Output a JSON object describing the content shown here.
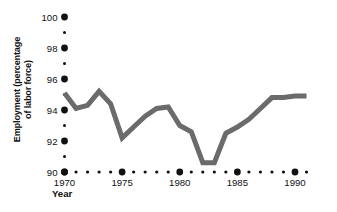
{
  "chart_data": {
    "type": "line",
    "title": "",
    "xlabel": "Year",
    "ylabel": "Employment (percentage of labor force)",
    "ylabel_line1": "Employment (percentage",
    "ylabel_line2": "of labor force)",
    "xlim": [
      1969.5,
      1991.2
    ],
    "ylim": [
      90,
      100
    ],
    "y_major_ticks": [
      90,
      92,
      94,
      96,
      98,
      100
    ],
    "y_major_tick_labels": [
      "90",
      "92",
      "94",
      "96",
      "98",
      "100"
    ],
    "y_minor_ticks": [
      91,
      93,
      95,
      97,
      99
    ],
    "x_major_ticks": [
      1970,
      1975,
      1980,
      1985,
      1990
    ],
    "x_major_tick_labels": [
      "1970",
      "1975",
      "1980",
      "1985",
      "1990"
    ],
    "x_minor_ticks": [
      1971,
      1972,
      1973,
      1974,
      1976,
      1977,
      1978,
      1979,
      1981,
      1982,
      1983,
      1984,
      1986,
      1987,
      1988,
      1989,
      1991
    ],
    "grid": false,
    "legend": null,
    "x": [
      1970,
      1971,
      1972,
      1973,
      1974,
      1975,
      1976,
      1977,
      1978,
      1979,
      1980,
      1981,
      1982,
      1983,
      1984,
      1985,
      1986,
      1987,
      1988,
      1989,
      1990,
      1991
    ],
    "values": [
      95.1,
      94.1,
      94.3,
      95.2,
      94.4,
      92.2,
      92.9,
      93.6,
      94.1,
      94.2,
      93.0,
      92.6,
      90.6,
      90.6,
      92.5,
      92.9,
      93.4,
      94.1,
      94.8,
      94.8,
      94.9,
      94.9
    ],
    "series": [
      {
        "name": "Employment",
        "color": "#6b6b6b",
        "linewidth": 5,
        "values": [
          95.1,
          94.1,
          94.3,
          95.2,
          94.4,
          92.2,
          92.9,
          93.6,
          94.1,
          94.2,
          93.0,
          92.6,
          90.6,
          90.6,
          92.5,
          92.9,
          93.4,
          94.1,
          94.8,
          94.8,
          94.9,
          94.9
        ]
      }
    ],
    "colors": {
      "line": "#6b6b6b",
      "tick_dot": "#111111",
      "text": "#111111",
      "background": "#ffffff"
    }
  }
}
